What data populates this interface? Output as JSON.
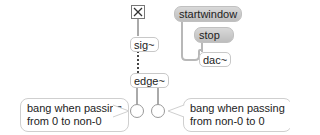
{
  "patch": {
    "toggle": {
      "state": "on",
      "glyph": "X"
    },
    "objects": {
      "sig": "sig~",
      "edge": "edge~",
      "dac": "dac~"
    },
    "messages": {
      "startwindow": "startwindow",
      "stop": "stop"
    },
    "comments": {
      "left": {
        "line1": "bang when passing",
        "line2": "from 0 to non-0"
      },
      "right": {
        "line1": "bang when passing",
        "line2": "from non-0 to 0"
      }
    },
    "colors": {
      "wire_control": "#b0b0b0",
      "wire_signal": "#555555",
      "message_bg": "#cccccc",
      "object_border": "#c8c8c8"
    }
  }
}
